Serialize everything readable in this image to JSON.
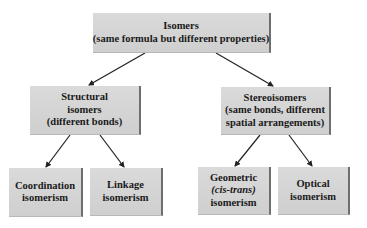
{
  "nodes": {
    "root": {
      "lines": [
        "Isomers",
        "(same formula but different properties)"
      ]
    },
    "structural": {
      "lines": [
        "Structural",
        "isomers",
        "(different bonds)"
      ]
    },
    "stereo": {
      "lines": [
        "Stereoisomers",
        "(same bonds, different",
        "spatial arrangements)"
      ]
    },
    "coordination": {
      "lines": [
        "Coordination",
        "isomerism"
      ]
    },
    "linkage": {
      "lines": [
        "Linkage",
        "isomerism"
      ]
    },
    "geometric": {
      "lines": [
        "Geometric",
        "(cis-trans)",
        "isomerism"
      ]
    },
    "optical": {
      "lines": [
        "Optical",
        "isomerism"
      ]
    }
  },
  "edges": [
    {
      "from": "root",
      "to": "structural"
    },
    {
      "from": "root",
      "to": "stereo"
    },
    {
      "from": "structural",
      "to": "coordination"
    },
    {
      "from": "structural",
      "to": "linkage"
    },
    {
      "from": "stereo",
      "to": "geometric"
    },
    {
      "from": "stereo",
      "to": "optical"
    }
  ],
  "colors": {
    "box_fill": "#d4d4d4",
    "box_shadow": "#6e6e6e",
    "arrow": "#222222",
    "text": "#1a1a1a"
  }
}
